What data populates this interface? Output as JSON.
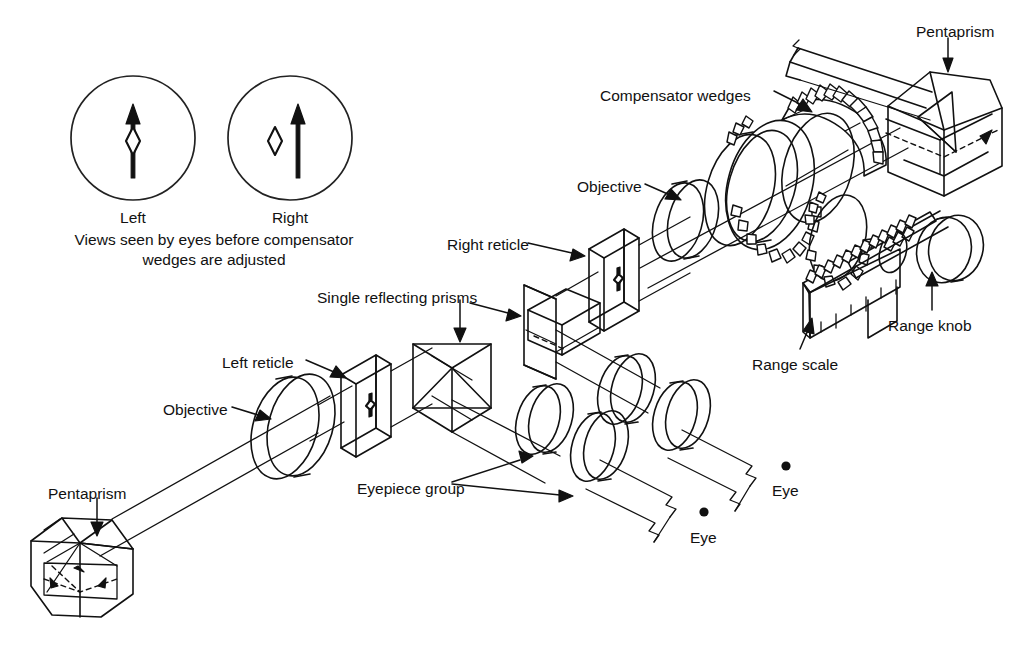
{
  "figure": {
    "kind": "optical-rangefinder-cutaway"
  },
  "eyepiece_views": {
    "caption_line1": "Views seen by eyes before compensator",
    "caption_line2": "wedges are adjusted",
    "views": [
      {
        "id": "left",
        "label": "Left",
        "cx": 133,
        "cy": 138,
        "r": 62,
        "arrow_offset_x": 0,
        "diamond_offset_x": 0,
        "aligned": true
      },
      {
        "id": "right",
        "label": "Right",
        "cx": 290,
        "cy": 138,
        "r": 62,
        "arrow_offset_x": 8,
        "diamond_offset_x": -18,
        "aligned": false
      }
    ]
  },
  "labels": [
    {
      "id": "pentaprism-upper",
      "text": "Pentaprism",
      "x": 916,
      "y": 22,
      "align": "left"
    },
    {
      "id": "compensator-wedges",
      "text": "Compensator wedges",
      "x": 600,
      "y": 86,
      "align": "left"
    },
    {
      "id": "objective-right",
      "text": "Objective",
      "x": 577,
      "y": 177,
      "align": "left"
    },
    {
      "id": "right-reticle",
      "text": "Right reticle",
      "x": 447,
      "y": 235,
      "align": "left"
    },
    {
      "id": "single-reflecting",
      "text": "Single reflecting prisms",
      "x": 317,
      "y": 288,
      "align": "left"
    },
    {
      "id": "range-knob",
      "text": "Range knob",
      "x": 888,
      "y": 316,
      "align": "left"
    },
    {
      "id": "range-scale",
      "text": "Range scale",
      "x": 752,
      "y": 355,
      "align": "left"
    },
    {
      "id": "left-reticle",
      "text": "Left reticle",
      "x": 222,
      "y": 353,
      "align": "left"
    },
    {
      "id": "objective-left",
      "text": "Objective",
      "x": 163,
      "y": 400,
      "align": "left"
    },
    {
      "id": "eyepiece-group",
      "text": "Eyepiece group",
      "x": 357,
      "y": 479,
      "align": "left"
    },
    {
      "id": "pentaprism-lower",
      "text": "Pentaprism",
      "x": 48,
      "y": 484,
      "align": "left"
    },
    {
      "id": "eye-upper",
      "text": "Eye",
      "x": 772,
      "y": 481,
      "align": "left"
    },
    {
      "id": "eye-lower",
      "text": "Eye",
      "x": 690,
      "y": 528,
      "align": "left"
    }
  ],
  "eye_markers": [
    {
      "id": "eye-dot-upper",
      "cx": 786,
      "cy": 466,
      "r": 4.6
    },
    {
      "id": "eye-dot-lower",
      "cx": 704,
      "cy": 512,
      "r": 4.6
    }
  ],
  "components": [
    {
      "id": "pentaprism-lower",
      "name": "Pentaprism",
      "count": 1
    },
    {
      "id": "pentaprism-upper",
      "name": "Pentaprism",
      "count": 1
    },
    {
      "id": "objective-left",
      "name": "Objective",
      "count": 1
    },
    {
      "id": "objective-right",
      "name": "Objective",
      "count": 1
    },
    {
      "id": "left-reticle",
      "name": "Left reticle",
      "count": 1
    },
    {
      "id": "right-reticle",
      "name": "Right reticle",
      "count": 1
    },
    {
      "id": "reflecting-prisms",
      "name": "Single reflecting prisms",
      "count": 2
    },
    {
      "id": "eyepiece-group",
      "name": "Eyepiece group",
      "count": 4
    },
    {
      "id": "compensator",
      "name": "Compensator wedges",
      "count": 2
    },
    {
      "id": "range-scale",
      "name": "Range scale",
      "count": 1
    },
    {
      "id": "range-knob",
      "name": "Range knob",
      "count": 1
    }
  ],
  "colors": {
    "ink": "#111111",
    "paper": "#ffffff"
  }
}
